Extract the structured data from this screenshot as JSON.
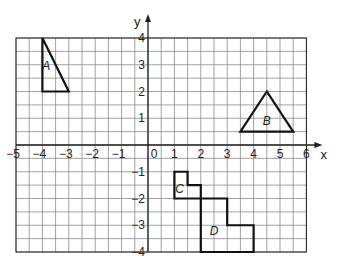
{
  "diagram": {
    "type": "coordinate-grid",
    "x_axis": {
      "label": "x",
      "min": -5,
      "max": 6,
      "ticks": [
        "-5",
        "-4",
        "-3",
        "-2",
        "-1",
        "0",
        "1",
        "2",
        "3",
        "4",
        "5",
        "6"
      ]
    },
    "y_axis": {
      "label": "y",
      "min": -4,
      "max": 4,
      "ticks": [
        "4",
        "3",
        "2",
        "1",
        "-1",
        "-2",
        "-3",
        "-4"
      ]
    },
    "grid_step": 0.5,
    "shapes": [
      {
        "name": "A",
        "kind": "triangle",
        "vertices": [
          [
            -4,
            4
          ],
          [
            -4,
            2
          ],
          [
            -3,
            2
          ]
        ],
        "label_pos": [
          -3.85,
          2.8
        ]
      },
      {
        "name": "B",
        "kind": "triangle",
        "vertices": [
          [
            4.5,
            2
          ],
          [
            3.5,
            0.5
          ],
          [
            5.5,
            0.5
          ]
        ],
        "label_pos": [
          4.5,
          0.75
        ]
      },
      {
        "name": "C",
        "kind": "polygon",
        "vertices": [
          [
            1,
            -1
          ],
          [
            1.5,
            -1
          ],
          [
            1.5,
            -1.5
          ],
          [
            2,
            -1.5
          ],
          [
            2,
            -2
          ],
          [
            1,
            -2
          ]
        ],
        "label_pos": [
          1.2,
          -1.8
        ]
      },
      {
        "name": "D",
        "kind": "polygon",
        "vertices": [
          [
            2,
            -2
          ],
          [
            3,
            -2
          ],
          [
            3,
            -3
          ],
          [
            4,
            -3
          ],
          [
            4,
            -4
          ],
          [
            2,
            -4
          ]
        ],
        "label_pos": [
          2.5,
          -3.35
        ]
      }
    ],
    "colors": {
      "grid": "#8a8a8a",
      "axis": "#222222",
      "shape": "#111111"
    }
  }
}
